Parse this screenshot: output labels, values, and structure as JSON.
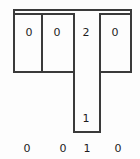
{
  "diagram": {
    "stroke_color": "#3a3a3a",
    "background_color": "#fdfdfd",
    "top_rail": {
      "label": "top-rail"
    },
    "cells": [
      {
        "value": "0",
        "x": 21,
        "y": 27
      },
      {
        "value": "0",
        "x": 53,
        "y": 27
      },
      {
        "value": "2",
        "x": 78,
        "y": 27
      },
      {
        "value": "0",
        "x": 111,
        "y": 27
      }
    ],
    "stem": {
      "value": "1",
      "x": 78,
      "y": 115
    },
    "bottom_labels": [
      {
        "value": "0",
        "x": 21,
        "y": 143
      },
      {
        "value": "0",
        "x": 57,
        "y": 143
      },
      {
        "value": "1",
        "x": 79,
        "y": 143
      },
      {
        "value": "0",
        "x": 112,
        "y": 143
      }
    ]
  }
}
